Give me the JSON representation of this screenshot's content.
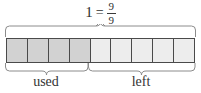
{
  "figure": {
    "title_equation": {
      "whole": "1",
      "equals": "=",
      "numerator": "9",
      "denominator": "9"
    },
    "bar": {
      "total_cells": 9,
      "used_cells": 4,
      "left_cells": 5,
      "cells": [
        {
          "index": 1,
          "state": "used"
        },
        {
          "index": 2,
          "state": "used"
        },
        {
          "index": 3,
          "state": "used"
        },
        {
          "index": 4,
          "state": "used"
        },
        {
          "index": 5,
          "state": "left"
        },
        {
          "index": 6,
          "state": "left"
        },
        {
          "index": 7,
          "state": "left"
        },
        {
          "index": 8,
          "state": "left"
        },
        {
          "index": 9,
          "state": "left"
        }
      ]
    },
    "braces": {
      "top_label": "1 = 9/9",
      "used_label": "used",
      "left_label": "left"
    },
    "labels": {
      "used": "used",
      "left": "left"
    },
    "colors": {
      "used_fill": "#d2d2d2",
      "left_fill": "#ededed",
      "cell_border": "#4a4a4a",
      "brace_stroke": "#8c8c8c",
      "text": "#333333",
      "background": "#ffffff"
    }
  },
  "chart_data": {
    "type": "bar",
    "title": "1 = 9/9",
    "categories": [
      "used",
      "left"
    ],
    "values": [
      4,
      5
    ],
    "unit_total": 9,
    "xlabel": "",
    "ylabel": "",
    "annotations": [
      "1 = 9/9"
    ]
  }
}
